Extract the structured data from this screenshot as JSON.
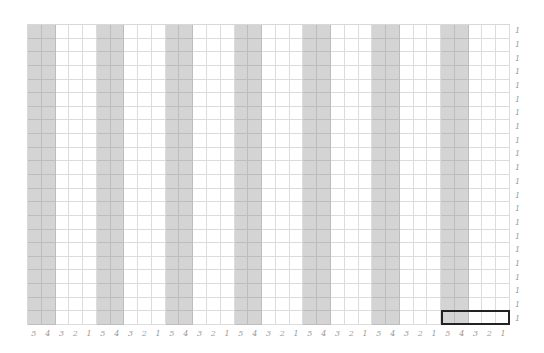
{
  "grid": {
    "columns": 35,
    "rows": 22,
    "group_size": 5,
    "shaded_positions_in_group": [
      0,
      1
    ],
    "colors": {
      "shaded": "#d4d4d4",
      "white": "#ffffff",
      "grid_line": "#dcdcdc",
      "highlight_border": "#222222",
      "label": "#9a9a9a"
    }
  },
  "column_labels": [
    "5",
    "4",
    "3",
    "2",
    "1",
    "5",
    "4",
    "3",
    "2",
    "1",
    "5",
    "4",
    "3",
    "2",
    "1",
    "5",
    "4",
    "3",
    "2",
    "1",
    "5",
    "4",
    "3",
    "2",
    "1",
    "5",
    "4",
    "3",
    "2",
    "1",
    "5",
    "4",
    "3",
    "2",
    "1"
  ],
  "row_labels": [
    "1",
    "1",
    "1",
    "1",
    "1",
    "1",
    "1",
    "1",
    "1",
    "1",
    "1",
    "1",
    "1",
    "1",
    "1",
    "1",
    "1",
    "1",
    "1",
    "1",
    "1",
    "1"
  ],
  "highlight": {
    "row": 22,
    "start_column": 31,
    "end_column": 35
  }
}
